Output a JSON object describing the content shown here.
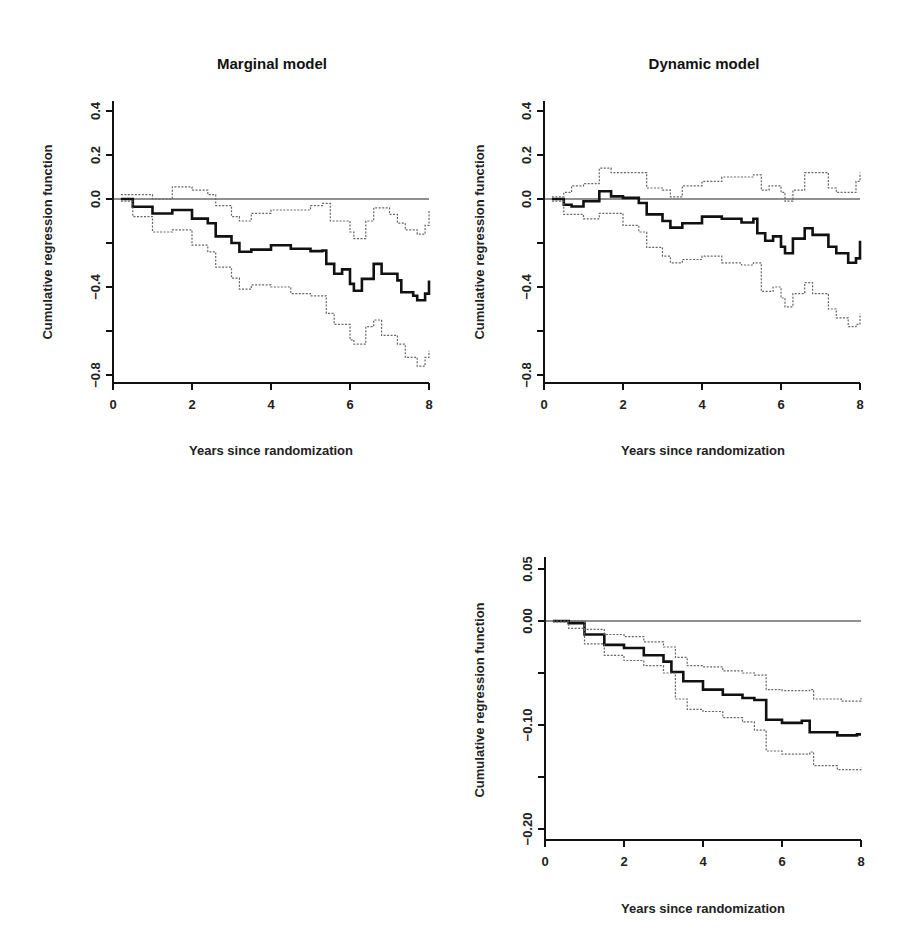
{
  "chart_data": [
    {
      "type": "line",
      "id": "marginal",
      "title": "Marginal model",
      "xlabel": "Years since randomization",
      "ylabel": "Cumulative regression function",
      "xlim": [
        0,
        8
      ],
      "ylim": [
        -0.85,
        0.45
      ],
      "xticks": [
        0,
        2,
        4,
        6,
        8
      ],
      "xtick_labels": [
        "0",
        "2",
        "4",
        "6",
        "8"
      ],
      "yticks": [
        -0.8,
        -0.6,
        -0.4,
        -0.2,
        0.0,
        0.2,
        0.4
      ],
      "ytick_labels": [
        "−0.8",
        "",
        "−0.4",
        "",
        "0.0",
        "0.2",
        "0.4"
      ],
      "reference_line": 0,
      "grid": false,
      "series": [
        {
          "name": "estimate",
          "style": "solid-thick",
          "x": [
            0.2,
            0.5,
            1.0,
            1.5,
            2.0,
            2.4,
            2.6,
            3.0,
            3.2,
            3.5,
            4.0,
            4.5,
            5.0,
            5.3,
            5.4,
            5.6,
            5.8,
            6.0,
            6.1,
            6.3,
            6.6,
            6.8,
            7.2,
            7.3,
            7.6,
            7.7,
            7.9,
            8.0
          ],
          "y": [
            0.0,
            -0.035,
            -0.066,
            -0.05,
            -0.089,
            -0.11,
            -0.17,
            -0.2,
            -0.24,
            -0.23,
            -0.21,
            -0.226,
            -0.237,
            -0.234,
            -0.295,
            -0.34,
            -0.32,
            -0.386,
            -0.417,
            -0.363,
            -0.295,
            -0.34,
            -0.37,
            -0.424,
            -0.44,
            -0.46,
            -0.43,
            -0.37
          ]
        },
        {
          "name": "upper confidence band",
          "style": "dotted",
          "x": [
            0.2,
            1.0,
            1.5,
            2.0,
            2.4,
            2.6,
            3.0,
            3.2,
            3.5,
            4.0,
            5.0,
            5.3,
            5.5,
            6.0,
            6.1,
            6.4,
            6.6,
            7.0,
            7.2,
            7.4,
            7.7,
            7.9,
            8.0
          ],
          "y": [
            0.02,
            0.0,
            0.055,
            0.04,
            0.02,
            -0.03,
            -0.08,
            -0.1,
            -0.065,
            -0.05,
            -0.03,
            -0.02,
            -0.1,
            -0.15,
            -0.18,
            -0.1,
            -0.04,
            -0.07,
            -0.11,
            -0.14,
            -0.16,
            -0.12,
            -0.05
          ]
        },
        {
          "name": "lower confidence band",
          "style": "dotted",
          "x": [
            0.2,
            0.5,
            1.0,
            1.5,
            2.0,
            2.4,
            2.6,
            3.0,
            3.2,
            3.5,
            4.0,
            4.5,
            5.0,
            5.4,
            5.6,
            6.0,
            6.1,
            6.4,
            6.6,
            6.8,
            7.2,
            7.4,
            7.7,
            7.9,
            8.0
          ],
          "y": [
            -0.01,
            -0.08,
            -0.15,
            -0.14,
            -0.21,
            -0.24,
            -0.31,
            -0.36,
            -0.41,
            -0.39,
            -0.4,
            -0.43,
            -0.44,
            -0.52,
            -0.57,
            -0.64,
            -0.66,
            -0.58,
            -0.55,
            -0.62,
            -0.66,
            -0.72,
            -0.76,
            -0.72,
            -0.69
          ]
        }
      ]
    },
    {
      "type": "line",
      "id": "dynamic",
      "title": "Dynamic model",
      "xlabel": "Years since randomization",
      "ylabel": "Cumulative regression function",
      "xlim": [
        0,
        8
      ],
      "ylim": [
        -0.85,
        0.45
      ],
      "xticks": [
        0,
        2,
        4,
        6,
        8
      ],
      "xtick_labels": [
        "0",
        "2",
        "4",
        "6",
        "8"
      ],
      "yticks": [
        -0.8,
        -0.6,
        -0.4,
        -0.2,
        0.0,
        0.2,
        0.4
      ],
      "ytick_labels": [
        "−0.8",
        "",
        "−0.4",
        "",
        "0.0",
        "0.2",
        "0.4"
      ],
      "reference_line": 0,
      "grid": false,
      "series": [
        {
          "name": "estimate",
          "style": "solid-thick",
          "x": [
            0.2,
            0.5,
            0.7,
            1.0,
            1.4,
            1.7,
            2.0,
            2.4,
            2.6,
            3.0,
            3.2,
            3.5,
            4.0,
            4.5,
            5.0,
            5.3,
            5.4,
            5.6,
            5.8,
            6.0,
            6.1,
            6.3,
            6.6,
            6.8,
            7.2,
            7.4,
            7.7,
            7.9,
            8.0
          ],
          "y": [
            0.0,
            -0.026,
            -0.034,
            -0.01,
            0.035,
            0.012,
            0.005,
            -0.018,
            -0.07,
            -0.1,
            -0.13,
            -0.11,
            -0.08,
            -0.09,
            -0.107,
            -0.09,
            -0.156,
            -0.19,
            -0.17,
            -0.217,
            -0.247,
            -0.18,
            -0.133,
            -0.163,
            -0.217,
            -0.247,
            -0.29,
            -0.27,
            -0.19
          ]
        },
        {
          "name": "upper confidence band",
          "style": "dotted",
          "x": [
            0.2,
            0.5,
            0.7,
            1.0,
            1.4,
            1.7,
            2.0,
            2.3,
            2.6,
            3.0,
            3.2,
            3.5,
            4.0,
            4.5,
            5.0,
            5.3,
            5.5,
            5.7,
            6.0,
            6.1,
            6.3,
            6.6,
            7.2,
            7.4,
            7.7,
            7.9,
            8.0
          ],
          "y": [
            0.01,
            0.03,
            0.06,
            0.07,
            0.14,
            0.12,
            0.12,
            0.12,
            0.05,
            0.04,
            0.01,
            0.06,
            0.08,
            0.1,
            0.1,
            0.11,
            0.04,
            0.06,
            0.03,
            -0.01,
            0.04,
            0.12,
            0.05,
            0.03,
            0.03,
            0.08,
            0.12
          ]
        },
        {
          "name": "lower confidence band",
          "style": "dotted",
          "x": [
            0.2,
            0.5,
            1.0,
            1.4,
            2.0,
            2.4,
            2.6,
            3.0,
            3.2,
            3.5,
            4.0,
            4.5,
            5.0,
            5.3,
            5.5,
            5.8,
            6.0,
            6.1,
            6.3,
            6.6,
            6.8,
            7.2,
            7.4,
            7.7,
            7.9,
            8.0
          ],
          "y": [
            -0.01,
            -0.07,
            -0.09,
            -0.065,
            -0.12,
            -0.15,
            -0.22,
            -0.26,
            -0.29,
            -0.275,
            -0.26,
            -0.29,
            -0.3,
            -0.29,
            -0.42,
            -0.4,
            -0.45,
            -0.49,
            -0.43,
            -0.38,
            -0.43,
            -0.5,
            -0.54,
            -0.58,
            -0.57,
            -0.52
          ]
        }
      ]
    },
    {
      "type": "line",
      "id": "third",
      "title": "",
      "xlabel": "Years since randomization",
      "ylabel": "Cumulative regression function",
      "xlim": [
        0,
        8
      ],
      "ylim": [
        -0.21,
        0.06
      ],
      "xticks": [
        0,
        2,
        4,
        6,
        8
      ],
      "xtick_labels": [
        "0",
        "2",
        "4",
        "6",
        "8"
      ],
      "yticks": [
        -0.2,
        -0.15,
        -0.1,
        -0.05,
        0.0,
        0.05
      ],
      "ytick_labels": [
        "−0.20",
        "",
        "−0.10",
        "",
        "0.00",
        "0.05"
      ],
      "reference_line": 0,
      "grid": false,
      "series": [
        {
          "name": "estimate",
          "style": "solid-thick",
          "x": [
            0.2,
            0.6,
            1.0,
            1.5,
            2.0,
            2.5,
            3.0,
            3.2,
            3.5,
            4.0,
            4.5,
            5.0,
            5.3,
            5.6,
            6.0,
            6.5,
            6.7,
            7.0,
            7.4,
            7.9,
            8.0
          ],
          "y": [
            0.0,
            -0.002,
            -0.013,
            -0.023,
            -0.026,
            -0.033,
            -0.039,
            -0.049,
            -0.058,
            -0.066,
            -0.071,
            -0.074,
            -0.076,
            -0.095,
            -0.098,
            -0.096,
            -0.107,
            -0.107,
            -0.11,
            -0.109,
            -0.109
          ]
        },
        {
          "name": "upper confidence band",
          "style": "dotted",
          "x": [
            0.2,
            0.6,
            1.0,
            1.5,
            2.0,
            2.5,
            3.0,
            3.3,
            3.6,
            4.0,
            4.5,
            5.0,
            5.3,
            5.6,
            6.0,
            6.7,
            6.8,
            7.5,
            8.0
          ],
          "y": [
            0.0,
            0.0,
            -0.008,
            -0.013,
            -0.015,
            -0.02,
            -0.025,
            -0.035,
            -0.043,
            -0.044,
            -0.048,
            -0.05,
            -0.052,
            -0.066,
            -0.067,
            -0.066,
            -0.075,
            -0.077,
            -0.074
          ]
        },
        {
          "name": "lower confidence band",
          "style": "dotted",
          "x": [
            0.2,
            0.6,
            1.0,
            1.5,
            2.0,
            2.5,
            3.0,
            3.3,
            3.6,
            4.0,
            4.5,
            5.0,
            5.3,
            5.6,
            6.0,
            6.7,
            6.8,
            7.4,
            8.0
          ],
          "y": [
            -0.001,
            -0.007,
            -0.022,
            -0.033,
            -0.038,
            -0.043,
            -0.05,
            -0.075,
            -0.085,
            -0.087,
            -0.093,
            -0.097,
            -0.105,
            -0.125,
            -0.128,
            -0.126,
            -0.139,
            -0.143,
            -0.141
          ]
        }
      ]
    }
  ]
}
